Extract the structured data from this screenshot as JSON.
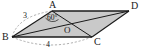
{
  "figure": {
    "kind": "geometry-diagram",
    "shape": "parallelogram",
    "background_color": "#ffffff",
    "fill_color": "#c9c9c9",
    "stroke_color": "#1a1a1a",
    "dashed_color": "#8a8a8a",
    "vertices": [
      {
        "id": "A",
        "label": "A",
        "x": 52,
        "y": 11
      },
      {
        "id": "B",
        "label": "B",
        "x": 12,
        "y": 37
      },
      {
        "id": "C",
        "label": "C",
        "x": 92,
        "y": 37
      },
      {
        "id": "D",
        "label": "D",
        "x": 129,
        "y": 11
      },
      {
        "id": "O",
        "label": "O",
        "x": 70,
        "y": 24
      }
    ],
    "edges": [
      {
        "from": "B",
        "to": "A"
      },
      {
        "from": "A",
        "to": "D"
      },
      {
        "from": "D",
        "to": "C"
      },
      {
        "from": "C",
        "to": "B"
      }
    ],
    "diagonals": [
      {
        "from": "A",
        "to": "C"
      },
      {
        "from": "B",
        "to": "D"
      }
    ],
    "dashed_arcs": [
      {
        "id": "arc-BA",
        "label": "3",
        "from": "B",
        "to": "A"
      },
      {
        "id": "arc-BC",
        "label": "4",
        "from": "B",
        "to": "C"
      }
    ],
    "measurements": [
      {
        "id": "side-BA",
        "label": "3",
        "unit": "",
        "x": 23,
        "y": 12
      },
      {
        "id": "side-BC",
        "label": "4",
        "unit": "",
        "x": 46,
        "y": 41
      }
    ],
    "angles": [
      {
        "id": "angle-at-A",
        "label": "60°",
        "vertex": "A",
        "x": 47,
        "y": 14
      }
    ]
  }
}
